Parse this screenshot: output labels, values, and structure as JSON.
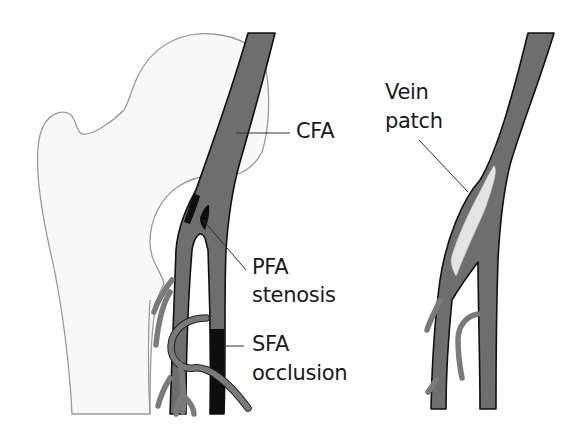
{
  "figure": {
    "type": "anatomical-diagram",
    "panels": [
      {
        "id": "before",
        "description": "Femoral bifurcation with PFA stenosis and SFA occlusion over proximal femur",
        "labels": {
          "cfa": "CFA",
          "pfa_line1": "PFA",
          "pfa_line2": "stenosis",
          "sfa_line1": "SFA",
          "sfa_line2": "occlusion"
        }
      },
      {
        "id": "after",
        "description": "Femoral bifurcation after repair with vein patch",
        "labels": {
          "vein_line1": "Vein",
          "vein_line2": "patch"
        }
      }
    ],
    "colors": {
      "artery_fill": "#6e6e6e",
      "artery_outline": "#111111",
      "occlusion": "#0e0e0e",
      "bone_fill": "#f8f8f8",
      "bone_outline": "#9a9a9a",
      "patch_fill": "#e4e4e4",
      "branch": "#7a7a7a"
    }
  }
}
